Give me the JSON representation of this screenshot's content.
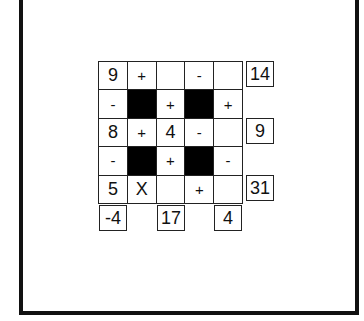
{
  "puzzle": {
    "grid": [
      [
        {
          "v": "9",
          "t": "num"
        },
        {
          "v": "+",
          "t": "op"
        },
        {
          "v": "",
          "t": "empty"
        },
        {
          "v": "-",
          "t": "op"
        },
        {
          "v": "",
          "t": "empty"
        }
      ],
      [
        {
          "v": "-",
          "t": "op"
        },
        {
          "v": "",
          "t": "black"
        },
        {
          "v": "+",
          "t": "op"
        },
        {
          "v": "",
          "t": "black"
        },
        {
          "v": "+",
          "t": "op"
        }
      ],
      [
        {
          "v": "8",
          "t": "num"
        },
        {
          "v": "+",
          "t": "op"
        },
        {
          "v": "4",
          "t": "num"
        },
        {
          "v": "-",
          "t": "op"
        },
        {
          "v": "",
          "t": "empty"
        }
      ],
      [
        {
          "v": "-",
          "t": "op"
        },
        {
          "v": "",
          "t": "black"
        },
        {
          "v": "+",
          "t": "op"
        },
        {
          "v": "",
          "t": "black"
        },
        {
          "v": "-",
          "t": "op"
        }
      ],
      [
        {
          "v": "5",
          "t": "num"
        },
        {
          "v": "X",
          "t": "op"
        },
        {
          "v": "",
          "t": "empty"
        },
        {
          "v": "+",
          "t": "op"
        },
        {
          "v": "",
          "t": "empty"
        }
      ]
    ],
    "row_results": {
      "row0": "14",
      "row2": "9",
      "row4": "31"
    },
    "col_results": {
      "col0": "-4",
      "col2": "17",
      "col4": "4"
    }
  }
}
